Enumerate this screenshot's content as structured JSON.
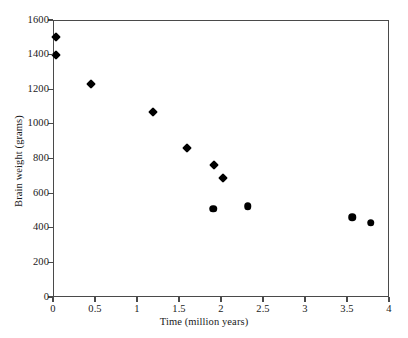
{
  "chart_data": {
    "type": "scatter",
    "title": "",
    "xlabel": "Time (million years)",
    "ylabel": "Brain weight (grams)",
    "xlim": [
      0,
      4
    ],
    "ylim": [
      0,
      1600
    ],
    "xticks": [
      0,
      0.5,
      1,
      1.5,
      2,
      2.5,
      3,
      3.5,
      4
    ],
    "xtick_labels": [
      "0",
      "0.5",
      "1",
      "1.5",
      "2",
      "2.5",
      "3",
      "3.5",
      "4"
    ],
    "yticks": [
      0,
      200,
      400,
      600,
      800,
      1000,
      1200,
      1400,
      1600
    ],
    "ytick_labels": [
      "0",
      "200",
      "400",
      "600",
      "800",
      "1000",
      "1200",
      "1400",
      "1600"
    ],
    "grid": false,
    "legend": null,
    "series": [
      {
        "name": "diamond-markers",
        "marker": "diamond",
        "color": "#000000",
        "points": [
          {
            "x": 0.04,
            "y": 1500
          },
          {
            "x": 0.04,
            "y": 1400
          },
          {
            "x": 0.45,
            "y": 1230
          },
          {
            "x": 1.19,
            "y": 1070
          },
          {
            "x": 1.59,
            "y": 860
          },
          {
            "x": 1.92,
            "y": 765
          },
          {
            "x": 2.02,
            "y": 690
          }
        ]
      },
      {
        "name": "circle-markers",
        "marker": "circle",
        "color": "#000000",
        "points": [
          {
            "x": 1.91,
            "y": 510
          },
          {
            "x": 2.32,
            "y": 525
          },
          {
            "x": 3.56,
            "y": 460
          },
          {
            "x": 3.78,
            "y": 430
          }
        ]
      }
    ],
    "axis_color": "#4a4a4a",
    "background": "#ffffff"
  }
}
